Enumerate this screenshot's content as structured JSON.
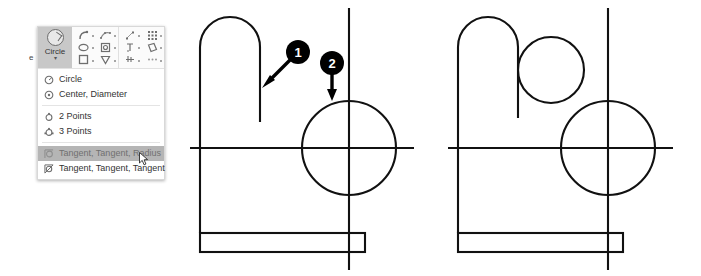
{
  "app": {
    "context": "CAD sketch circle tool — Tangent, Tangent, Radius selection with before/after geometry",
    "truncated_ribbon_text": "e"
  },
  "ribbon": {
    "circle_button": {
      "label": "Circle",
      "icon": "circle-tool-icon",
      "dropdown_caret": "▾",
      "state": "active"
    },
    "icon_groups": [
      {
        "name": "sketch-entities-group",
        "icons": [
          "arc-icon",
          "spline-icon",
          "ellipse-icon",
          "slot-icon",
          "rectangle-icon",
          "polygon-icon"
        ]
      },
      {
        "name": "sketch-tools-group",
        "icons": [
          "point-icon",
          "grid-pattern-icon",
          "text-icon",
          "plane-icon",
          "dimension-icon",
          "more-icon"
        ]
      }
    ]
  },
  "menu": {
    "name": "circle-tool-dropdown",
    "groups": [
      {
        "items": [
          {
            "label": "Circle",
            "icon": "circle-icon",
            "selected": false
          },
          {
            "label": "Center, Diameter",
            "icon": "center-diameter-icon",
            "selected": false
          }
        ]
      },
      {
        "items": [
          {
            "label": "2 Points",
            "icon": "two-points-icon",
            "selected": false
          },
          {
            "label": "3 Points",
            "icon": "three-points-icon",
            "selected": false
          }
        ]
      },
      {
        "items": [
          {
            "label": "Tangent, Tangent, Radius",
            "icon": "tangent-tangent-radius-icon",
            "selected": true
          },
          {
            "label": "Tangent, Tangent, Tangent",
            "icon": "tangent-tangent-tangent-icon",
            "selected": false
          }
        ]
      }
    ]
  },
  "callouts": [
    {
      "number": "1",
      "target": "arch-right-vertical-edge",
      "cx": 298,
      "cy": 52
    },
    {
      "number": "2",
      "target": "large-circle-top-tangent-point",
      "cx": 332,
      "cy": 63
    }
  ],
  "drawings": {
    "left": {
      "name": "before-sketch",
      "description": "Arch profile, centerlines and large circle before the tangent circle is added",
      "stroke_color": "#111111"
    },
    "right": {
      "name": "after-sketch",
      "description": "Same sketch with a new small circle tangent to the arch edge and the large circle",
      "stroke_color": "#111111"
    }
  },
  "colors": {
    "stroke": "#111111",
    "panel_bg": "#ffffff",
    "ribbon_bg": "#fbfbfb",
    "button_active_bg": "#c8c8c8",
    "menu_selected_bg": "#b5b5b5",
    "menu_text": "#333333",
    "callout_fill": "#000000",
    "callout_text": "#ffffff"
  }
}
